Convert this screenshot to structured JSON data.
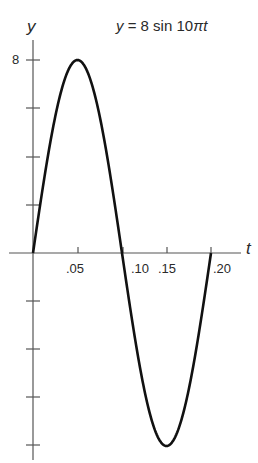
{
  "chart_data": {
    "type": "line",
    "title": "y = 8 sin 10πt",
    "title_parts": {
      "y": "y",
      "eq": " = 8 sin 10",
      "pi_t": "πt"
    },
    "xlabel": "t",
    "ylabel": "y",
    "x_ticks": [
      0,
      0.05,
      0.1,
      0.15,
      0.2
    ],
    "x_tick_labels": [
      ".05",
      ".10",
      ".15",
      ".20"
    ],
    "y_ticks": [
      -8,
      -6,
      -4,
      -2,
      0,
      2,
      4,
      6,
      8
    ],
    "y_tick_labels": [
      "8"
    ],
    "xlim": [
      0,
      0.2
    ],
    "ylim": [
      -8,
      8
    ],
    "grid": false,
    "series": [
      {
        "name": "y = 8 sin 10πt",
        "x": [
          0,
          0.025,
          0.05,
          0.075,
          0.1,
          0.125,
          0.15,
          0.175,
          0.2
        ],
        "values": [
          0,
          5.66,
          8,
          5.66,
          0,
          -5.66,
          -8,
          -5.66,
          0
        ]
      }
    ]
  },
  "labels": {
    "y_axis": "y",
    "x_axis": "t",
    "y_tick_8": "8",
    "x_05": ".05",
    "x_10": ".10",
    "x_15": ".15",
    "x_20": ".20"
  }
}
